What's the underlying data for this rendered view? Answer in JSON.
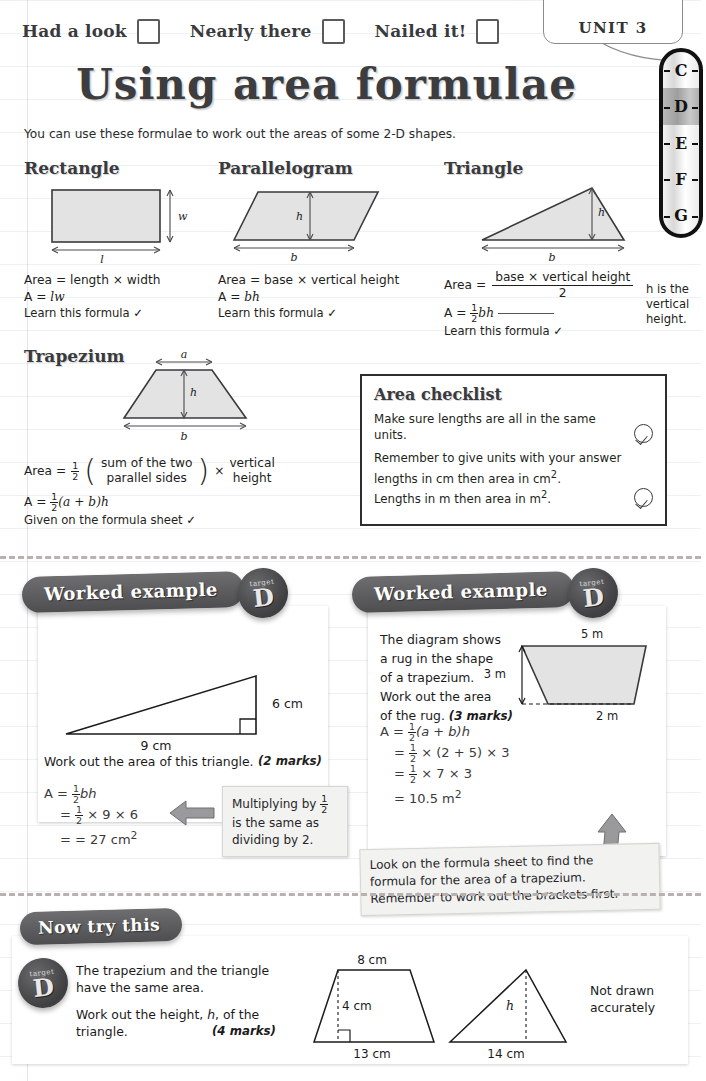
{
  "header": {
    "progress": [
      {
        "label": "Had a look",
        "checked": false
      },
      {
        "label": "Nearly there",
        "checked": false
      },
      {
        "label": "Nailed it!",
        "checked": false
      }
    ],
    "unit_tab": "UNIT 3",
    "grades": [
      "C",
      "D",
      "E",
      "F",
      "G"
    ],
    "current_grade": "D"
  },
  "title": "Using area formulae",
  "intro": "You can use these formulae to work out the areas of some 2-D shapes.",
  "shapes": [
    {
      "name": "Rectangle",
      "diagram_labels": [
        "l",
        "w"
      ],
      "area_words": "Area = length × width",
      "formula_a": "A =",
      "formula_b": "lw",
      "note": "Learn this formula ✓"
    },
    {
      "name": "Parallelogram",
      "diagram_labels": [
        "b",
        "h"
      ],
      "area_words": "Area = base × vertical height",
      "formula_a": "A =",
      "formula_b": "bh",
      "note": "Learn this formula ✓"
    },
    {
      "name": "Triangle",
      "diagram_labels": [
        "b",
        "h"
      ],
      "area_words": "Area =",
      "area_numerator": "base × vertical height",
      "area_denominator": "2",
      "formula_a": "A =",
      "formula_frac_num": "1",
      "formula_frac_den": "2",
      "formula_b": "bh",
      "note": "Learn this formula ✓",
      "side_note": "h is the vertical height."
    },
    {
      "name": "Trapezium",
      "diagram_labels": [
        "a",
        "b",
        "h"
      ],
      "area_words": "Area =",
      "bracket_line1": "sum of the two",
      "bracket_line2": "parallel sides",
      "times": "×",
      "vertical_line1": "vertical",
      "vertical_line2": "height",
      "formula_a": "A =",
      "formula_b": "(a + b)h",
      "note": "Given on the formula sheet ✓"
    }
  ],
  "area_checklist": {
    "title": "Area checklist",
    "items": [
      "Make sure lengths are all in the same units.",
      "Remember to give units with your answer lengths in cm then area in cm². Lengths in m then area in m²."
    ],
    "tick_glyph": "✓"
  },
  "worked_example_1": {
    "banner": "Worked example",
    "target_word": "target",
    "target_grade": "D",
    "diagram": {
      "base_label": "9 cm",
      "height_label": "6 cm"
    },
    "question": "Work out the area of this triangle.",
    "marks": "(2 marks)",
    "working": [
      {
        "lhs": "A =",
        "frac_num": "1",
        "frac_den": "2",
        "rhs": "bh"
      },
      {
        "lhs": "=",
        "frac_num": "1",
        "frac_den": "2",
        "rhs": "× 9 × 6"
      },
      {
        "lhs": "=",
        "frac_num": "",
        "frac_den": "",
        "rhs": "27 cm²"
      }
    ],
    "hint_line1": "Multiplying by",
    "hint_frac_num": "1",
    "hint_frac_den": "2",
    "hint_line2": "is the same as",
    "hint_line3": "dividing by 2."
  },
  "worked_example_2": {
    "banner": "Worked example",
    "target_word": "target",
    "target_grade": "D",
    "question_lines": [
      "The diagram shows",
      "a rug in the shape",
      "of a trapezium.",
      "Work out the area",
      "of the rug."
    ],
    "marks": "(3 marks)",
    "diagram": {
      "top_label": "5 m",
      "bottom_label": "2 m",
      "height_label": "3 m"
    },
    "working": [
      {
        "lhs": "A =",
        "frac_num": "1",
        "frac_den": "2",
        "rhs": "(a + b)h"
      },
      {
        "lhs": "=",
        "frac_num": "1",
        "frac_den": "2",
        "rhs": "× (2 + 5) × 3"
      },
      {
        "lhs": "=",
        "frac_num": "1",
        "frac_den": "2",
        "rhs": "× 7 × 3"
      },
      {
        "lhs": "=",
        "frac_num": "",
        "frac_den": "",
        "rhs": "10.5 m²"
      }
    ],
    "hint_line1": "Look on the formula sheet to find the",
    "hint_line2": "formula for the area of a trapezium.",
    "hint_line3": "Remember to work out the brackets first."
  },
  "now_try_this": {
    "banner": "Now try this",
    "target_word": "target",
    "target_grade": "D",
    "question_line1": "The trapezium and the triangle have the same area.",
    "question_line2": "Work out the height, h, of the triangle.",
    "marks": "(4 marks)",
    "trapezium": {
      "top": "8 cm",
      "height": "4 cm",
      "bottom": "13 cm"
    },
    "triangle": {
      "height": "h",
      "base": "14 cm"
    },
    "note_line1": "Not drawn",
    "note_line2": "accurately"
  },
  "colors": {
    "shape_fill": "#e3e3e3",
    "ink": "#2e2e30",
    "banner": "#58585a",
    "separator": "#b9b0b0"
  }
}
